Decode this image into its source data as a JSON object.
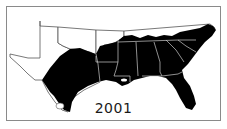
{
  "map": {
    "title": "2001",
    "region": "Southeastern United States",
    "fill_color": "#000000",
    "outline_color": "#555555",
    "background_color": "#ffffff",
    "legend": {
      "shaded": "distribution range (2001)"
    }
  }
}
